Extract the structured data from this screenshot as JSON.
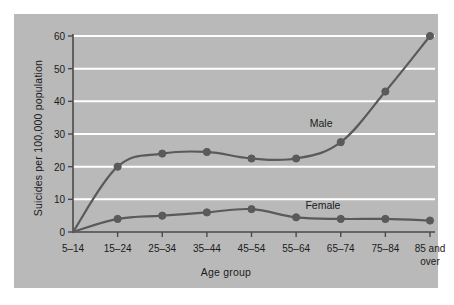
{
  "figure": {
    "background_color": "#ffffff",
    "panel_color": "#b9b9b9",
    "gridline_color": "#ffffff",
    "axis_color": "#4a4a4a",
    "series_color": "#5a5a5a",
    "text_color": "#1b1b1b"
  },
  "chart_data": {
    "type": "line",
    "title": "",
    "subtitle": "",
    "xlabel": "Age group",
    "ylabel": "Suicides per 100,000 population",
    "categories": [
      "5–14",
      "15–24",
      "25–34",
      "35–44",
      "45–54",
      "55–64",
      "65–74",
      "75–84",
      "85 and over"
    ],
    "category_lines": [
      [
        "5–14"
      ],
      [
        "15–24"
      ],
      [
        "25–34"
      ],
      [
        "35–44"
      ],
      [
        "45–54"
      ],
      [
        "55–64"
      ],
      [
        "65–74"
      ],
      [
        "75–84"
      ],
      [
        "85 and",
        "over"
      ]
    ],
    "yticks": [
      0,
      10,
      20,
      30,
      40,
      50,
      60
    ],
    "ytick_labels": [
      "0",
      "10",
      "20",
      "30",
      "40",
      "50",
      "60"
    ],
    "ylim": [
      0,
      60
    ],
    "grid": "horizontal",
    "legend": "inline-annotations",
    "markers": "circle",
    "smoothing": "spline",
    "series": [
      {
        "name": "Male",
        "values": [
          0,
          20,
          24,
          24.5,
          22.5,
          22.5,
          27.5,
          43,
          60
        ],
        "annotation": "Male"
      },
      {
        "name": "Female",
        "values": [
          0,
          4,
          5,
          6,
          7,
          4.5,
          4,
          4,
          3.5
        ],
        "annotation": "Female"
      }
    ],
    "annotations": [
      {
        "text": "Male",
        "x_frac": 0.695,
        "y_value": 33.5
      },
      {
        "text": "Female",
        "x_frac": 0.7,
        "y_value": 8.2
      }
    ]
  }
}
